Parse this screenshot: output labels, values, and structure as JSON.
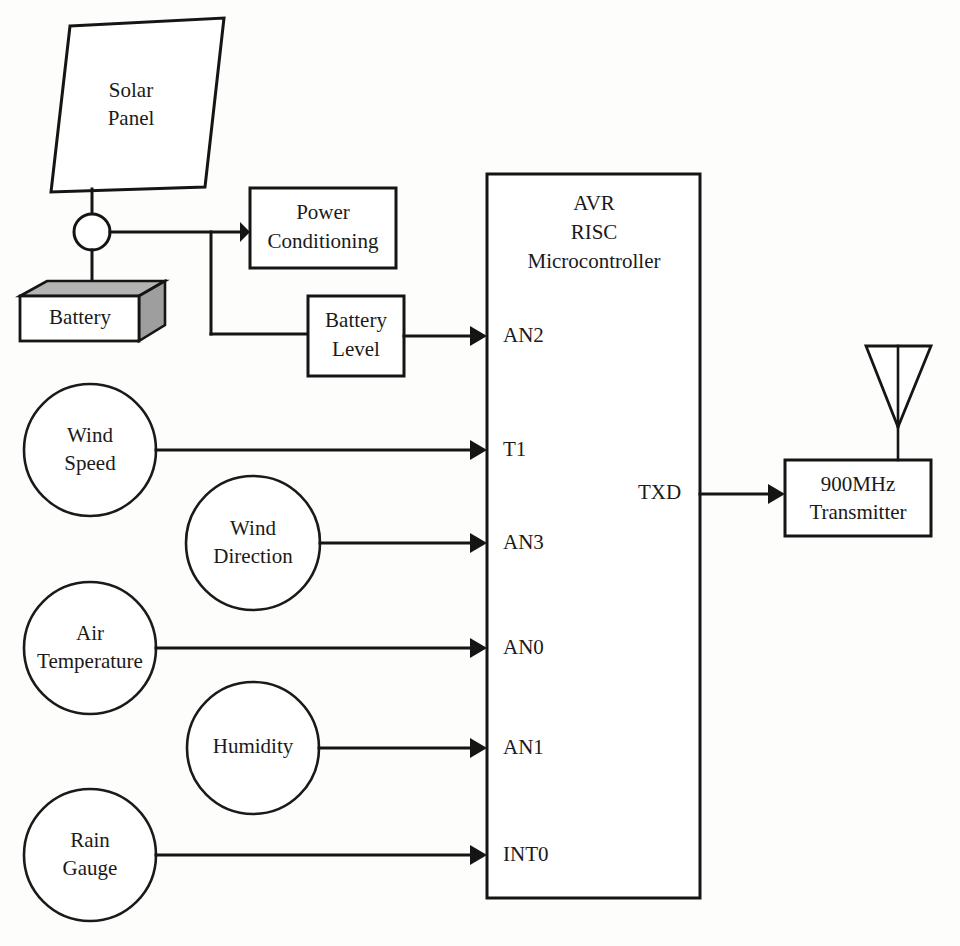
{
  "diagram": {
    "background_color": "#fdfdfc",
    "line_color": "#151515",
    "battery_shade_color": "#b4b4b4"
  },
  "power": {
    "solar_panel": {
      "line1": "Solar",
      "line2": "Panel"
    },
    "junction_node": "junction-dot",
    "battery": {
      "label": "Battery"
    },
    "power_conditioning": {
      "line1": "Power",
      "line2": "Conditioning"
    },
    "battery_level": {
      "line1": "Battery",
      "line2": "Level"
    }
  },
  "sensors": [
    {
      "id": "wind-speed",
      "line1": "Wind",
      "line2": "Speed",
      "pin": "AN2_unused"
    },
    {
      "id": "wind-direction",
      "line1": "Wind",
      "line2": "Direction",
      "pin": "AN3"
    },
    {
      "id": "air-temperature",
      "line1": "Air",
      "line2": "Temperature",
      "pin": "AN0"
    },
    {
      "id": "humidity",
      "line1": "Humidity",
      "line2": "",
      "pin": "AN1"
    },
    {
      "id": "rain-gauge",
      "line1": "Rain",
      "line2": "Gauge",
      "pin": "INT0"
    }
  ],
  "mcu": {
    "title_line1": "AVR",
    "title_line2": "RISC",
    "title_line3": "Microcontroller",
    "pins_in": [
      {
        "name": "AN2",
        "source": "Battery Level"
      },
      {
        "name": "T1",
        "source": "Wind Speed"
      },
      {
        "name": "AN3",
        "source": "Wind Direction"
      },
      {
        "name": "AN0",
        "source": "Air Temperature"
      },
      {
        "name": "AN1",
        "source": "Humidity"
      },
      {
        "name": "INT0",
        "source": "Rain Gauge"
      }
    ],
    "pins_out": [
      {
        "name": "TXD",
        "target": "900MHz Transmitter"
      }
    ]
  },
  "radio": {
    "transmitter": {
      "line1": "900MHz",
      "line2": "Transmitter"
    },
    "antenna": "antenna-icon"
  }
}
